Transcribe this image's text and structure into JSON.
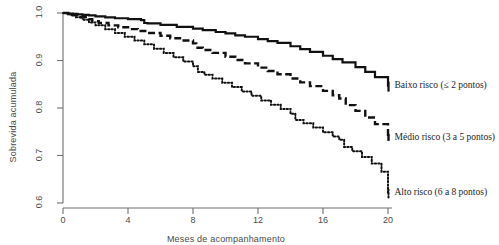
{
  "chart_data": {
    "type": "line",
    "subtype": "kaplan-meier-survival-step",
    "title": "",
    "xlabel": "Meses de acompanhamento",
    "ylabel": "Sobrevida acumulada",
    "xlim": [
      0,
      20
    ],
    "ylim": [
      0.6,
      1.0
    ],
    "xticks": [
      0,
      4,
      8,
      12,
      16,
      20
    ],
    "xtick_labels": [
      "0",
      "4",
      "8",
      "12",
      "16",
      "20"
    ],
    "yticks": [
      0.6,
      0.7,
      0.8,
      0.9,
      1.0
    ],
    "ytick_labels": [
      "0.6",
      "0.7",
      "0.8",
      "0.9",
      "1.0"
    ],
    "grid": false,
    "legend_position": "right-inline-at-curve-end",
    "series": [
      {
        "name": "Baixo risco (≤ 2 pontos)",
        "style": "solid",
        "color": "#111111",
        "label_x": 20.4,
        "label_y": 0.845,
        "x": [
          0,
          0.3,
          0.6,
          0.9,
          1.2,
          1.6,
          2.0,
          2.6,
          3.2,
          4.0,
          4.8,
          5.0,
          5.2,
          6.0,
          7.0,
          8.0,
          8.6,
          9.4,
          10.0,
          10.6,
          11.2,
          12.0,
          12.6,
          13.2,
          14.0,
          14.6,
          15.2,
          16.0,
          16.6,
          17.2,
          18.0,
          18.6,
          19.2,
          20.0
        ],
        "y": [
          1.0,
          0.999,
          0.998,
          0.997,
          0.996,
          0.995,
          0.993,
          0.991,
          0.989,
          0.987,
          0.985,
          0.979,
          0.978,
          0.975,
          0.971,
          0.967,
          0.964,
          0.96,
          0.957,
          0.953,
          0.95,
          0.945,
          0.941,
          0.937,
          0.93,
          0.924,
          0.918,
          0.91,
          0.903,
          0.896,
          0.886,
          0.876,
          0.865,
          0.845
        ]
      },
      {
        "name": "Médio risco (3 a 5 pontos)",
        "style": "dashed",
        "color": "#111111",
        "label_x": 20.4,
        "label_y": 0.735,
        "x": [
          0,
          0.3,
          0.6,
          1.0,
          1.4,
          1.8,
          2.2,
          2.8,
          3.4,
          4.0,
          4.6,
          5.2,
          6.0,
          6.6,
          7.2,
          8.0,
          8.2,
          8.6,
          9.2,
          10.0,
          10.6,
          11.2,
          12.0,
          12.6,
          13.2,
          14.0,
          14.6,
          15.2,
          16.0,
          16.6,
          17.0,
          17.4,
          18.0,
          18.6,
          19.2,
          20.0
        ],
        "y": [
          1.0,
          0.998,
          0.995,
          0.991,
          0.987,
          0.983,
          0.979,
          0.974,
          0.97,
          0.966,
          0.962,
          0.958,
          0.952,
          0.947,
          0.942,
          0.936,
          0.927,
          0.922,
          0.916,
          0.908,
          0.901,
          0.894,
          0.885,
          0.878,
          0.871,
          0.862,
          0.854,
          0.846,
          0.836,
          0.827,
          0.82,
          0.806,
          0.794,
          0.78,
          0.766,
          0.735
        ]
      },
      {
        "name": "Alto risco (6 a 8 pontos)",
        "style": "dotted",
        "color": "#111111",
        "label_x": 20.4,
        "label_y": 0.618,
        "x": [
          0,
          0.4,
          0.8,
          1.2,
          1.6,
          2.0,
          2.6,
          3.2,
          3.8,
          4.4,
          5.0,
          5.6,
          6.2,
          6.8,
          7.4,
          8.0,
          8.3,
          8.7,
          9.2,
          9.8,
          10.4,
          11.0,
          11.6,
          12.2,
          12.8,
          13.4,
          14.0,
          14.3,
          14.8,
          15.4,
          16.0,
          16.6,
          17.0,
          17.3,
          17.8,
          18.4,
          19.0,
          19.6,
          20.0
        ],
        "y": [
          1.0,
          0.996,
          0.991,
          0.986,
          0.98,
          0.974,
          0.966,
          0.958,
          0.95,
          0.942,
          0.934,
          0.925,
          0.916,
          0.907,
          0.898,
          0.888,
          0.876,
          0.87,
          0.862,
          0.853,
          0.844,
          0.835,
          0.826,
          0.816,
          0.807,
          0.798,
          0.788,
          0.775,
          0.768,
          0.759,
          0.749,
          0.74,
          0.733,
          0.718,
          0.709,
          0.697,
          0.683,
          0.666,
          0.618
        ]
      }
    ]
  },
  "axes": {
    "x_title": "Meses de acompanhamento",
    "y_title": "Sobrevida acumulada"
  }
}
